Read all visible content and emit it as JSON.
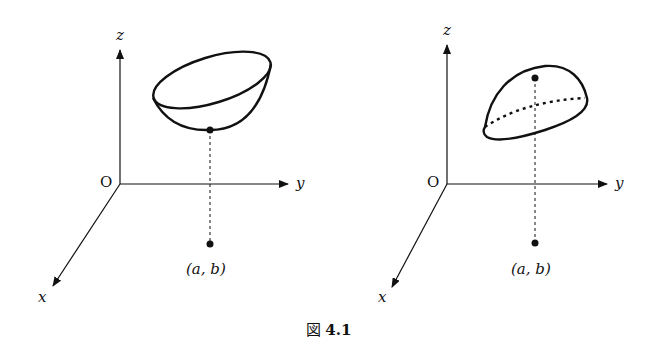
{
  "figure": {
    "caption_prefix": "図",
    "caption_number": "4.1"
  },
  "left_panel": {
    "description": "Surface with a local minimum above point (a, b)",
    "axes": {
      "z": "z",
      "y": "y",
      "x": "x",
      "origin": "O"
    },
    "point_label": "(a, b)"
  },
  "right_panel": {
    "description": "Surface with a local maximum above point (a, b)",
    "axes": {
      "z": "z",
      "y": "y",
      "x": "x",
      "origin": "O"
    },
    "point_label": "(a, b)"
  }
}
